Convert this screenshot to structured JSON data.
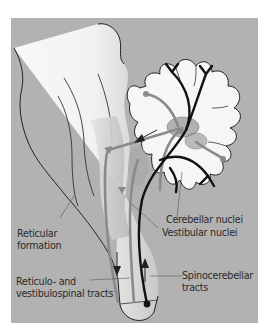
{
  "diagram": {
    "colors": {
      "background_panel": "#b2b2b2",
      "tissue": "#f7f7f7",
      "outline": "#222222",
      "gray_pathway": "#8a8a8a",
      "black_pathway": "#111111",
      "nuclei_fill": "#9a9a9a"
    },
    "labels": {
      "reticular_formation_line1": "Reticular",
      "reticular_formation_line2": "formation",
      "cerebellar_nuclei": "Cerebellar nuclei",
      "vestibular_nuclei": "Vestibular nuclei",
      "reticulo_line1": "Reticulo- and",
      "reticulo_line2": "vestibulospinal tracts",
      "spinocerebellar_line1": "Spinocerebellar",
      "spinocerebellar_line2": "tracts"
    },
    "structures": [
      "brainstem",
      "cerebellum",
      "cerebellar nuclei",
      "vestibular nuclei",
      "reticular formation",
      "spinal cord"
    ],
    "arrows": [
      {
        "name": "descending-arrow",
        "direction": "down",
        "pathway": "reticulo- and vestibulospinal tracts"
      },
      {
        "name": "ascending-arrow",
        "direction": "up",
        "pathway": "spinocerebellar tracts"
      },
      {
        "name": "cerebellar-output-arrow",
        "direction": "left",
        "pathway": "cerebellar efferents to brainstem"
      }
    ]
  }
}
